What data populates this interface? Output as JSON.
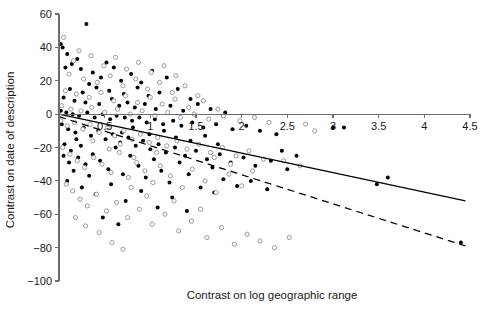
{
  "chart_data": {
    "type": "scatter",
    "title": "",
    "xlabel": "Contrast on log geographic range",
    "ylabel": "Contrast on date of description",
    "xlim": [
      0,
      4.5
    ],
    "ylim": [
      -100,
      60
    ],
    "xticks": [
      0,
      0.5,
      1,
      1.5,
      2,
      2.5,
      3,
      3.5,
      4,
      4.5
    ],
    "xtick_labels": [
      "0",
      "0.5",
      "1",
      "1.5",
      "2",
      "2.5",
      "3",
      "3.5",
      "4",
      "4.5"
    ],
    "yticks": [
      -100,
      -80,
      -60,
      -40,
      -20,
      0,
      20,
      40,
      60
    ],
    "ytick_labels": [
      "-100",
      "-80",
      "-60",
      "-40",
      "-20",
      "0",
      "20",
      "40",
      "60"
    ],
    "grid": false,
    "legend": "none",
    "xaxis_position_y": 0,
    "series": [
      {
        "name": "filled-circles",
        "marker": "filled-circle",
        "color": "#000000",
        "points": [
          [
            0.02,
            42
          ],
          [
            0.04,
            40
          ],
          [
            0.3,
            54
          ],
          [
            0.09,
            36
          ],
          [
            0.2,
            33
          ],
          [
            0.14,
            30
          ],
          [
            0.07,
            28
          ],
          [
            0.24,
            27
          ],
          [
            0.37,
            25
          ],
          [
            0.52,
            31
          ],
          [
            0.46,
            22
          ],
          [
            0.6,
            28
          ],
          [
            0.68,
            20
          ],
          [
            0.79,
            24
          ],
          [
            0.9,
            19
          ],
          [
            1.02,
            26
          ],
          [
            1.18,
            22
          ],
          [
            0.33,
            18
          ],
          [
            0.41,
            16
          ],
          [
            0.12,
            15
          ],
          [
            0.26,
            13
          ],
          [
            0.55,
            14
          ],
          [
            0.71,
            12
          ],
          [
            0.86,
            16
          ],
          [
            0.98,
            11
          ],
          [
            1.1,
            13
          ],
          [
            1.3,
            15
          ],
          [
            1.44,
            9
          ],
          [
            0.05,
            10
          ],
          [
            0.17,
            8
          ],
          [
            0.29,
            7
          ],
          [
            0.44,
            6
          ],
          [
            0.58,
            9
          ],
          [
            0.66,
            5
          ],
          [
            0.75,
            7
          ],
          [
            0.83,
            4
          ],
          [
            0.94,
            6
          ],
          [
            1.06,
            3
          ],
          [
            1.22,
            5
          ],
          [
            1.36,
            2
          ],
          [
            1.52,
            6
          ],
          [
            1.66,
            3
          ],
          [
            1.82,
            1
          ],
          [
            0.02,
            2
          ],
          [
            0.08,
            1
          ],
          [
            0.15,
            0
          ],
          [
            0.22,
            -1
          ],
          [
            0.31,
            1
          ],
          [
            0.39,
            -2
          ],
          [
            0.48,
            0
          ],
          [
            0.56,
            -3
          ],
          [
            0.63,
            -1
          ],
          [
            0.72,
            -2
          ],
          [
            0.8,
            -4
          ],
          [
            0.88,
            -2
          ],
          [
            0.96,
            -5
          ],
          [
            1.05,
            -3
          ],
          [
            1.14,
            -6
          ],
          [
            1.25,
            -4
          ],
          [
            1.34,
            -7
          ],
          [
            1.46,
            -5
          ],
          [
            1.58,
            -8
          ],
          [
            1.72,
            -6
          ],
          [
            1.9,
            -9
          ],
          [
            2.05,
            -7
          ],
          [
            2.2,
            -10
          ],
          [
            2.38,
            -12
          ],
          [
            3.0,
            -8
          ],
          [
            3.12,
            -8
          ],
          [
            0.03,
            -6
          ],
          [
            0.1,
            -9
          ],
          [
            0.18,
            -11
          ],
          [
            0.27,
            -8
          ],
          [
            0.35,
            -13
          ],
          [
            0.43,
            -10
          ],
          [
            0.51,
            -15
          ],
          [
            0.59,
            -12
          ],
          [
            0.67,
            -17
          ],
          [
            0.76,
            -14
          ],
          [
            0.84,
            -19
          ],
          [
            0.92,
            -16
          ],
          [
            1.0,
            -21
          ],
          [
            1.09,
            -18
          ],
          [
            1.17,
            -23
          ],
          [
            1.27,
            -20
          ],
          [
            1.38,
            -25
          ],
          [
            1.5,
            -22
          ],
          [
            1.62,
            -27
          ],
          [
            1.76,
            -24
          ],
          [
            1.88,
            -29
          ],
          [
            2.02,
            -26
          ],
          [
            2.15,
            -31
          ],
          [
            2.32,
            -28
          ],
          [
            2.5,
            -33
          ],
          [
            0.06,
            -18
          ],
          [
            0.13,
            -22
          ],
          [
            0.21,
            -26
          ],
          [
            0.29,
            -30
          ],
          [
            0.37,
            -24
          ],
          [
            0.45,
            -28
          ],
          [
            0.54,
            -33
          ],
          [
            0.62,
            -20
          ],
          [
            0.7,
            -36
          ],
          [
            0.78,
            -25
          ],
          [
            0.87,
            -31
          ],
          [
            0.95,
            -38
          ],
          [
            1.04,
            -27
          ],
          [
            1.12,
            -34
          ],
          [
            1.21,
            -41
          ],
          [
            1.32,
            -29
          ],
          [
            1.42,
            -36
          ],
          [
            1.55,
            -44
          ],
          [
            1.68,
            -32
          ],
          [
            1.8,
            -39
          ],
          [
            0.09,
            -40
          ],
          [
            0.25,
            -44
          ],
          [
            0.4,
            -48
          ],
          [
            0.57,
            -42
          ],
          [
            0.73,
            -52
          ],
          [
            0.9,
            -46
          ],
          [
            1.08,
            -56
          ],
          [
            1.24,
            -50
          ],
          [
            1.4,
            -58
          ],
          [
            0.48,
            -62
          ],
          [
            0.65,
            -66
          ],
          [
            1.7,
            -47
          ],
          [
            1.95,
            -43
          ],
          [
            2.1,
            -40
          ],
          [
            2.28,
            -45
          ],
          [
            3.6,
            -38
          ],
          [
            3.48,
            -42
          ],
          [
            4.4,
            -77
          ],
          [
            0.16,
            -34
          ],
          [
            0.33,
            -37
          ],
          [
            0.05,
            -25
          ],
          [
            0.11,
            -29
          ],
          [
            0.19,
            -15
          ],
          [
            0.24,
            -19
          ],
          [
            0.99,
            -12
          ],
          [
            1.15,
            -10
          ],
          [
            1.28,
            -14
          ],
          [
            1.44,
            -16
          ],
          [
            1.6,
            -13
          ],
          [
            1.74,
            -18
          ],
          [
            2.44,
            -22
          ],
          [
            2.6,
            -25
          ],
          [
            0.81,
            -8
          ],
          [
            0.69,
            -11
          ]
        ]
      },
      {
        "name": "open-circles",
        "marker": "open-circle",
        "color": "#8a8a8a",
        "points": [
          [
            0.05,
            46
          ],
          [
            0.22,
            38
          ],
          [
            0.16,
            32
          ],
          [
            0.35,
            35
          ],
          [
            0.49,
            29
          ],
          [
            0.62,
            34
          ],
          [
            0.74,
            27
          ],
          [
            0.87,
            31
          ],
          [
            1.01,
            25
          ],
          [
            1.15,
            29
          ],
          [
            1.28,
            23
          ],
          [
            0.11,
            24
          ],
          [
            0.27,
            21
          ],
          [
            0.42,
            19
          ],
          [
            0.56,
            23
          ],
          [
            0.7,
            17
          ],
          [
            0.84,
            21
          ],
          [
            0.97,
            15
          ],
          [
            1.1,
            19
          ],
          [
            1.24,
            13
          ],
          [
            1.38,
            17
          ],
          [
            1.52,
            11
          ],
          [
            0.07,
            14
          ],
          [
            0.19,
            12
          ],
          [
            0.33,
            10
          ],
          [
            0.46,
            13
          ],
          [
            0.6,
            8
          ],
          [
            0.73,
            11
          ],
          [
            0.86,
            7
          ],
          [
            1.0,
            10
          ],
          [
            1.13,
            6
          ],
          [
            1.27,
            9
          ],
          [
            1.42,
            4
          ],
          [
            1.58,
            8
          ],
          [
            1.74,
            3
          ],
          [
            0.03,
            5
          ],
          [
            0.13,
            3
          ],
          [
            0.24,
            2
          ],
          [
            0.36,
            4
          ],
          [
            0.5,
            1
          ],
          [
            0.64,
            3
          ],
          [
            0.78,
            0
          ],
          [
            0.91,
            2
          ],
          [
            1.05,
            -1
          ],
          [
            1.19,
            1
          ],
          [
            1.33,
            -2
          ],
          [
            1.48,
            0
          ],
          [
            1.64,
            -3
          ],
          [
            1.8,
            -1
          ],
          [
            1.98,
            -4
          ],
          [
            2.14,
            -2
          ],
          [
            2.3,
            -5
          ],
          [
            2.7,
            -6
          ],
          [
            0.02,
            -4
          ],
          [
            0.09,
            -7
          ],
          [
            0.17,
            -5
          ],
          [
            0.26,
            -9
          ],
          [
            0.34,
            -6
          ],
          [
            0.44,
            -11
          ],
          [
            0.53,
            -8
          ],
          [
            0.61,
            -13
          ],
          [
            0.71,
            -10
          ],
          [
            0.8,
            -15
          ],
          [
            0.89,
            -12
          ],
          [
            0.99,
            -17
          ],
          [
            1.08,
            -14
          ],
          [
            1.18,
            -19
          ],
          [
            1.29,
            -16
          ],
          [
            1.4,
            -21
          ],
          [
            1.53,
            -18
          ],
          [
            1.66,
            -23
          ],
          [
            1.79,
            -20
          ],
          [
            1.94,
            -25
          ],
          [
            2.08,
            -22
          ],
          [
            2.24,
            -27
          ],
          [
            0.04,
            -20
          ],
          [
            0.12,
            -24
          ],
          [
            0.2,
            -28
          ],
          [
            0.28,
            -32
          ],
          [
            0.38,
            -26
          ],
          [
            0.47,
            -30
          ],
          [
            0.57,
            -35
          ],
          [
            0.66,
            -23
          ],
          [
            0.76,
            -38
          ],
          [
            0.85,
            -29
          ],
          [
            0.94,
            -34
          ],
          [
            1.03,
            -41
          ],
          [
            1.11,
            -31
          ],
          [
            1.22,
            -37
          ],
          [
            1.35,
            -44
          ],
          [
            1.46,
            -33
          ],
          [
            1.6,
            -40
          ],
          [
            1.72,
            -47
          ],
          [
            1.86,
            -36
          ],
          [
            2.0,
            -43
          ],
          [
            0.08,
            -42
          ],
          [
            0.15,
            -46
          ],
          [
            0.23,
            -51
          ],
          [
            0.31,
            -55
          ],
          [
            0.41,
            -48
          ],
          [
            0.52,
            -58
          ],
          [
            0.63,
            -53
          ],
          [
            0.75,
            -62
          ],
          [
            0.88,
            -57
          ],
          [
            1.02,
            -66
          ],
          [
            1.16,
            -60
          ],
          [
            1.31,
            -70
          ],
          [
            1.45,
            -64
          ],
          [
            1.62,
            -74
          ],
          [
            1.78,
            -68
          ],
          [
            1.92,
            -78
          ],
          [
            2.06,
            -72
          ],
          [
            2.2,
            -76
          ],
          [
            2.36,
            -80
          ],
          [
            2.52,
            -74
          ],
          [
            0.18,
            -62
          ],
          [
            0.29,
            -67
          ],
          [
            0.44,
            -71
          ],
          [
            0.58,
            -77
          ],
          [
            0.7,
            -81
          ],
          [
            2.64,
            -31
          ],
          [
            2.46,
            -28
          ],
          [
            2.12,
            -34
          ],
          [
            1.88,
            -30
          ],
          [
            1.7,
            -26
          ],
          [
            2.8,
            -10
          ],
          [
            1.55,
            -57
          ],
          [
            1.26,
            -52
          ],
          [
            0.96,
            -49
          ],
          [
            0.79,
            -44
          ],
          [
            0.37,
            -16
          ],
          [
            0.55,
            -21
          ],
          [
            0.67,
            -18
          ],
          [
            0.82,
            -26
          ],
          [
            1.07,
            -23
          ]
        ]
      }
    ],
    "fit_lines": [
      {
        "name": "solid-regression-line",
        "style": "solid",
        "x0": 0.0,
        "y0": 0.0,
        "x1": 4.45,
        "y1": -52.0
      },
      {
        "name": "dashed-regression-line",
        "style": "dashed",
        "x0": 0.0,
        "y0": -1.5,
        "x1": 4.45,
        "y1": -79.0
      }
    ]
  }
}
